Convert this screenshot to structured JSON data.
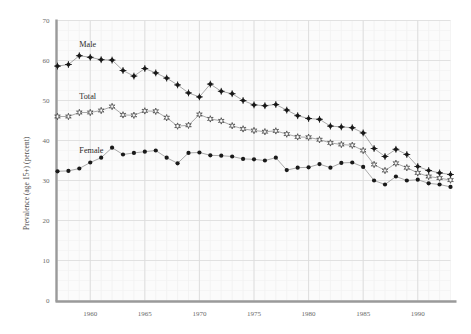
{
  "chart_data": {
    "type": "line",
    "title": "",
    "subtitle": "",
    "xlabel": "",
    "ylabel": "Prevalence (age 15+) (percent)",
    "xlim": [
      1957,
      1993
    ],
    "ylim": [
      0,
      70
    ],
    "xticks": [
      1960,
      1965,
      1970,
      1975,
      1980,
      1985,
      1990
    ],
    "xticklabels": [
      "1960",
      "1965",
      "1970",
      "1975",
      "1980",
      "1985",
      "1990"
    ],
    "yticks": [
      0,
      10,
      20,
      30,
      40,
      50,
      60,
      70
    ],
    "yticklabels": [
      "0",
      "10",
      "20",
      "30",
      "40",
      "50",
      "60",
      "70"
    ],
    "grid": true,
    "grid_minor": true,
    "legend_position": "inline-annotation",
    "x": [
      1957,
      1958,
      1959,
      1960,
      1961,
      1962,
      1963,
      1964,
      1965,
      1966,
      1967,
      1968,
      1969,
      1970,
      1971,
      1972,
      1973,
      1974,
      1975,
      1976,
      1977,
      1978,
      1979,
      1980,
      1981,
      1982,
      1983,
      1984,
      1985,
      1986,
      1987,
      1988,
      1989,
      1990,
      1991,
      1992,
      1993
    ],
    "series": [
      {
        "name": "Male",
        "marker": "diamond-filled",
        "color": "#1a1a1a",
        "label_x": 1959.0,
        "label_y": 63.5,
        "values": [
          58.6,
          59.0,
          61.2,
          60.8,
          60.2,
          60.1,
          57.5,
          56.1,
          58.0,
          56.9,
          55.6,
          53.9,
          51.9,
          50.9,
          54.1,
          52.3,
          51.7,
          50.0,
          48.9,
          48.7,
          49.0,
          47.6,
          46.2,
          45.5,
          45.3,
          43.6,
          43.4,
          43.2,
          41.9,
          38.0,
          36.0,
          37.8,
          36.5,
          33.5,
          32.5,
          31.9,
          31.5
        ]
      },
      {
        "name": "Total",
        "marker": "star-open",
        "color": "#3a3a3a",
        "label_x": 1959.0,
        "label_y": 50.5,
        "values": [
          46.0,
          46.0,
          47.0,
          47.0,
          47.5,
          48.5,
          46.4,
          46.3,
          47.4,
          47.3,
          45.7,
          43.6,
          43.8,
          46.5,
          45.4,
          44.9,
          43.7,
          42.9,
          42.5,
          42.2,
          42.4,
          41.6,
          40.9,
          40.8,
          40.2,
          39.4,
          39.0,
          38.8,
          37.5,
          34.0,
          32.5,
          34.3,
          33.2,
          31.9,
          31.0,
          30.6,
          30.1
        ]
      },
      {
        "name": "Female",
        "marker": "circle-filled",
        "color": "#1a1a1a",
        "label_x": 1959.0,
        "label_y": 37.0,
        "values": [
          32.3,
          32.4,
          33.0,
          34.5,
          35.7,
          38.2,
          36.5,
          36.9,
          37.2,
          37.5,
          35.7,
          34.3,
          36.9,
          37.0,
          36.3,
          36.2,
          36.0,
          35.4,
          35.3,
          35.0,
          35.7,
          32.6,
          33.2,
          33.3,
          34.1,
          33.2,
          34.4,
          34.5,
          33.4,
          30.0,
          29.0,
          31.0,
          30.0,
          30.2,
          29.3,
          29.0,
          28.4
        ]
      }
    ]
  },
  "axis": {
    "y_title": "Prevalence (age 15+) (percent)"
  }
}
